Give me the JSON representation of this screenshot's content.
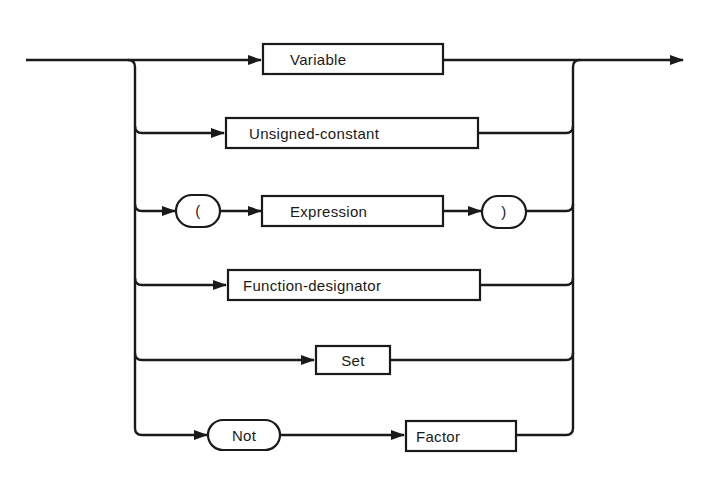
{
  "diagram": {
    "type": "syntax-diagram",
    "rule": "Factor",
    "colors": {
      "ink": "#1a1a1a",
      "background": "#ffffff"
    },
    "alternatives": [
      {
        "id": "variable",
        "elements": [
          {
            "kind": "nonterminal",
            "label": "Variable"
          }
        ]
      },
      {
        "id": "unsigned-constant",
        "elements": [
          {
            "kind": "nonterminal",
            "label": "Unsigned-constant"
          }
        ]
      },
      {
        "id": "parenthesized",
        "elements": [
          {
            "kind": "terminal",
            "label": "("
          },
          {
            "kind": "nonterminal",
            "label": "Expression"
          },
          {
            "kind": "terminal",
            "label": ")"
          }
        ]
      },
      {
        "id": "function-designator",
        "elements": [
          {
            "kind": "nonterminal",
            "label": "Function-designator"
          }
        ]
      },
      {
        "id": "set",
        "elements": [
          {
            "kind": "nonterminal",
            "label": "Set"
          }
        ]
      },
      {
        "id": "not-factor",
        "elements": [
          {
            "kind": "terminal",
            "label": "Not"
          },
          {
            "kind": "nonterminal",
            "label": "Factor"
          }
        ]
      }
    ]
  }
}
